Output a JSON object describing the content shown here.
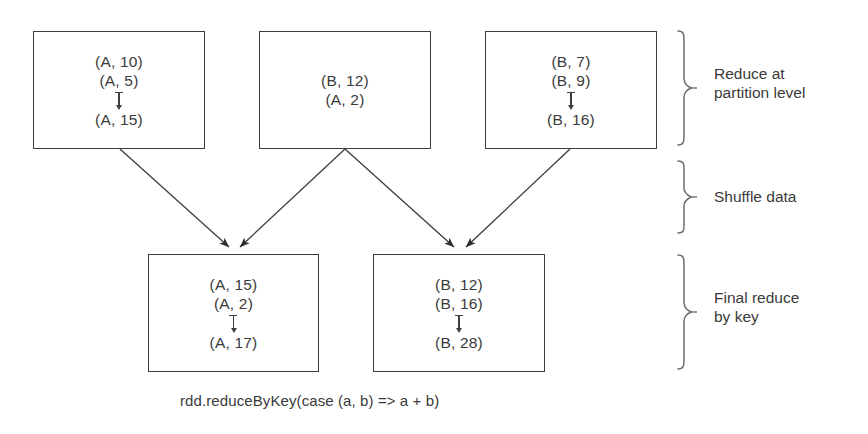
{
  "diagram": {
    "caption": "rdd.reduceByKey(case (a, b) => a + b)",
    "ink_color": "#3a3a3a",
    "background_color": "#ffffff",
    "partition_boxes": [
      {
        "id": "partition-1",
        "lines": [
          "(A, 10)",
          "(A, 5)"
        ],
        "arrow": "down-arrow",
        "result": "(A, 15)"
      },
      {
        "id": "partition-2",
        "lines": [
          "(B, 12)",
          "(A, 2)"
        ],
        "arrow": null,
        "result": null
      },
      {
        "id": "partition-3",
        "lines": [
          "(B, 7)",
          "(B, 9)"
        ],
        "arrow": "down-arrow",
        "result": "(B, 16)"
      }
    ],
    "result_boxes": [
      {
        "id": "final-reduce-a",
        "lines": [
          "(A, 15)",
          "(A, 2)"
        ],
        "arrow": "down-arrow",
        "result": "(A, 17)"
      },
      {
        "id": "final-reduce-b",
        "lines": [
          "(B, 12)",
          "(B, 16)"
        ],
        "arrow": "down-arrow",
        "result": "(B, 28)"
      }
    ],
    "stage_labels": [
      {
        "id": "stage-reduce-partition",
        "text": "Reduce at\npartition level"
      },
      {
        "id": "stage-shuffle",
        "text": "Shuffle data"
      },
      {
        "id": "stage-final-reduce",
        "text": "Final reduce\nby key"
      }
    ]
  }
}
